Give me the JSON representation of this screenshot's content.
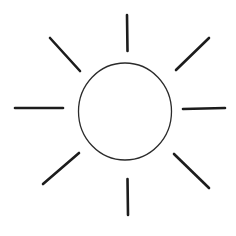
{
  "figure": {
    "background_color": "#ffffff",
    "canvas": {
      "width": 236,
      "height": 236
    }
  },
  "drawing": {
    "type": "line-drawing",
    "subject": "sun",
    "stroke_color": "#1c1c1c",
    "circle_stroke_color": "#2b2b2b",
    "circle": {
      "label": "sun disc",
      "cx": 125,
      "cy": 111.5,
      "rx": 46.5,
      "ry": 48.5,
      "stroke_width": 1.3
    },
    "rays": [
      {
        "label": "ray-n",
        "direction": "north",
        "x1": 127,
        "y1": 15,
        "x2": 127.5,
        "y2": 51,
        "stroke_width": 2.6
      },
      {
        "label": "ray-ne",
        "direction": "northeast",
        "x1": 209,
        "y1": 38,
        "x2": 176,
        "y2": 70,
        "stroke_width": 2.6
      },
      {
        "label": "ray-e",
        "direction": "east",
        "x1": 225,
        "y1": 108,
        "x2": 183,
        "y2": 109,
        "stroke_width": 2.6
      },
      {
        "label": "ray-se",
        "direction": "southeast",
        "x1": 209,
        "y1": 188,
        "x2": 174,
        "y2": 154,
        "stroke_width": 2.6
      },
      {
        "label": "ray-s",
        "direction": "south",
        "x1": 128,
        "y1": 215,
        "x2": 127.5,
        "y2": 179,
        "stroke_width": 2.6
      },
      {
        "label": "ray-sw",
        "direction": "southwest",
        "x1": 43,
        "y1": 184,
        "x2": 79,
        "y2": 153,
        "stroke_width": 2.6
      },
      {
        "label": "ray-w",
        "direction": "west",
        "x1": 15,
        "y1": 108,
        "x2": 63,
        "y2": 108,
        "stroke_width": 2.6
      },
      {
        "label": "ray-nw",
        "direction": "northwest",
        "x1": 50,
        "y1": 38,
        "x2": 80,
        "y2": 71,
        "stroke_width": 2.6
      }
    ]
  }
}
